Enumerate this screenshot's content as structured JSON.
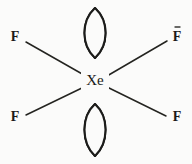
{
  "figure": {
    "type": "chemical-structure-diagram",
    "width": 192,
    "height": 164,
    "background_color": "#fbfbfa",
    "ink_color": "#1c1c1a"
  },
  "central_atom": {
    "label": "Xe",
    "name": "xenon",
    "x": 95,
    "y": 81
  },
  "terminal_atoms": [
    {
      "id": "f-top-left",
      "label": "F",
      "x": 15,
      "y": 38,
      "position": "top-left"
    },
    {
      "id": "f-top-right",
      "label": "F",
      "x": 177,
      "y": 38,
      "position": "top-right"
    },
    {
      "id": "f-bottom-left",
      "label": "F",
      "x": 15,
      "y": 118,
      "position": "bottom-left"
    },
    {
      "id": "f-bottom-right",
      "label": "F",
      "x": 177,
      "y": 118,
      "position": "bottom-right"
    }
  ],
  "bonds": [
    {
      "id": "bond-top-left",
      "x1": 84,
      "y1": 75,
      "x2": 26,
      "y2": 42
    },
    {
      "id": "bond-top-right",
      "x1": 107,
      "y1": 76,
      "x2": 167,
      "y2": 41
    },
    {
      "id": "bond-bottom-left",
      "x1": 84,
      "y1": 87,
      "x2": 26,
      "y2": 115
    },
    {
      "id": "bond-bottom-right",
      "x1": 107,
      "y1": 87,
      "x2": 166,
      "y2": 116
    }
  ],
  "lone_pairs": [
    {
      "id": "lone-pair-top",
      "label": "lone pair (hatched lens)",
      "cx": 95,
      "cy": 33,
      "rx": 14,
      "ry": 25,
      "hatch_direction": "lower-left to upper-right",
      "hatch_count": 11
    },
    {
      "id": "lone-pair-bottom",
      "label": "lone pair (hatched lens)",
      "cx": 95,
      "cy": 130,
      "rx": 14,
      "ry": 26,
      "hatch_direction": "lower-left to upper-right",
      "hatch_count": 11
    }
  ],
  "marks": [
    {
      "id": "tick-above-top-right-f",
      "label": "-",
      "x": 177,
      "y": 27,
      "length": 5
    }
  ]
}
